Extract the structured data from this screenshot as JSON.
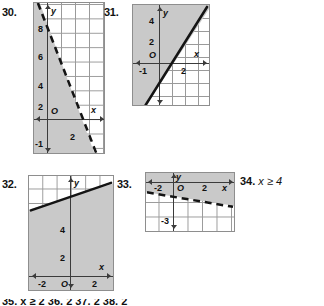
{
  "page": {
    "background": "#ffffff",
    "shade_color": "#c9c9c9",
    "grid_color": "#9a9a9a",
    "axis_color": "#3b3b3b",
    "line_color": "#141414"
  },
  "exercises": [
    {
      "id": "30",
      "number": "30.",
      "type": "graph",
      "boundary_style": "dashed",
      "shade_region": "left",
      "axis_labels": {
        "x": "x",
        "y": "y",
        "origin": "O"
      },
      "x_ticks": [
        "2"
      ],
      "y_ticks": [
        "8",
        "6",
        "4",
        "2",
        "-1"
      ]
    },
    {
      "id": "31",
      "number": "31.",
      "type": "graph",
      "boundary_style": "solid",
      "shade_region": "upper-left",
      "axis_labels": {
        "x": "x",
        "y": "y",
        "origin": "O"
      },
      "x_ticks": [
        "-1",
        "2"
      ],
      "y_ticks": [
        "4",
        "2"
      ]
    },
    {
      "id": "32",
      "number": "32.",
      "type": "graph",
      "boundary_style": "solid",
      "shade_region": "below",
      "axis_labels": {
        "x": "x",
        "y": "y",
        "origin": "O"
      },
      "x_ticks": [
        "-2",
        "2"
      ],
      "y_ticks": [
        "4",
        "2"
      ]
    },
    {
      "id": "33",
      "number": "33.",
      "type": "graph",
      "boundary_style": "dashed",
      "shade_region": "above",
      "axis_labels": {
        "x": "x",
        "y": "y",
        "origin": "O"
      },
      "x_ticks": [
        "-2",
        "2"
      ],
      "y_ticks": [
        "-3"
      ]
    },
    {
      "id": "34",
      "number": "34.",
      "type": "text",
      "expression": "x ≥ 4"
    }
  ],
  "clipped_bottom_row": {
    "visible": true,
    "text": "35.   x ≥ 2   36.   2   37.   2   38.   2"
  }
}
